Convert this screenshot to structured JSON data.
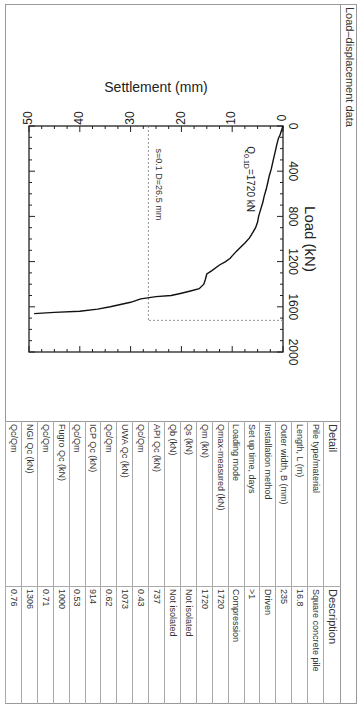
{
  "title": "Load–displacement data",
  "chart_data": {
    "type": "line",
    "title": "",
    "xlabel": "Load (kN)",
    "ylabel": "Settlement (mm)",
    "xlim": [
      0,
      2000
    ],
    "ylim": [
      0,
      50
    ],
    "y_inverted": true,
    "x_ticks": [
      0,
      400,
      800,
      1200,
      1600,
      2000
    ],
    "y_ticks": [
      0,
      10,
      20,
      30,
      40,
      50
    ],
    "grid": false,
    "series": [
      {
        "name": "Load-settlement curve",
        "x": [
          0,
          40,
          80,
          110,
          160,
          220,
          300,
          380,
          440,
          500,
          560,
          620,
          680,
          740,
          800,
          850,
          900,
          940,
          990,
          1030,
          1070,
          1110,
          1150,
          1170,
          1200,
          1230,
          1280,
          1310,
          1360,
          1400,
          1440,
          1460,
          1480,
          1500,
          1510,
          1530,
          1560,
          1580,
          1600,
          1620,
          1640,
          1650,
          1660
        ],
        "y": [
          0,
          0.3,
          0.6,
          0.9,
          1.2,
          1.5,
          1.9,
          2.3,
          2.7,
          3.0,
          3.3,
          3.7,
          4.0,
          4.4,
          4.8,
          5.0,
          5.4,
          5.9,
          6.6,
          7.4,
          8.3,
          9.2,
          10.0,
          10.4,
          11.3,
          12.5,
          14.0,
          15.0,
          15.3,
          15.6,
          16.5,
          18.2,
          20.0,
          22.0,
          25.0,
          28.0,
          30.0,
          32.0,
          34.0,
          36.5,
          40.0,
          45.0,
          49.0
        ]
      }
    ],
    "annotations": [
      {
        "text": "Q0.1D=1720 kN",
        "label_main": "Q",
        "label_sub": "0.1D",
        "label_value": "=1720 kN"
      },
      {
        "text": "s=0.1 D=26.5 mm"
      }
    ],
    "reference_lines": [
      {
        "type": "horizontal",
        "settlement": 26.5,
        "from_load": 0,
        "to_load": 1720,
        "style": "dashed"
      },
      {
        "type": "vertical",
        "load": 1720,
        "from_settlement": 0,
        "to_settlement": 26.5,
        "style": "dashed"
      }
    ]
  },
  "table": {
    "headers": [
      "Detail",
      "Description"
    ],
    "rows": [
      {
        "detail": "Pile type/material",
        "value": "Square concrete pile"
      },
      {
        "detail": "Length, L (m)",
        "value": "16.8"
      },
      {
        "detail": "Outer width, B (mm)",
        "value": "235"
      },
      {
        "detail": "Installation method",
        "value": "Driven"
      },
      {
        "detail": "Set up time, days",
        "value": ">1"
      },
      {
        "detail": "Loading mode",
        "value": "Compression"
      },
      {
        "detail": "Qmax-measured (kN)",
        "value": "1720"
      },
      {
        "detail": "Qm (kN)",
        "value": "1720"
      },
      {
        "detail": "Qs (kN)",
        "value": "Not isolated"
      },
      {
        "detail": "Qb (kN)",
        "value": "Not isolated"
      },
      {
        "detail": "API Qc (kN)",
        "value": "737"
      },
      {
        "detail": "Qc/Qm",
        "value": "0.43"
      },
      {
        "detail": "UWA Qc (kN)",
        "value": "1073"
      },
      {
        "detail": "Qc/Qm",
        "value": "0.62"
      },
      {
        "detail": "ICP Qc (kN)",
        "value": "914"
      },
      {
        "detail": "Qc/Qm",
        "value": "0.53"
      },
      {
        "detail": "Fugro Qc (kN)",
        "value": "1000"
      },
      {
        "detail": "Qc/Qm",
        "value": "0.71"
      },
      {
        "detail": "NGI Qc (kN)",
        "value": "1306"
      },
      {
        "detail": "Qc/Qm",
        "value": "0.76"
      }
    ]
  }
}
